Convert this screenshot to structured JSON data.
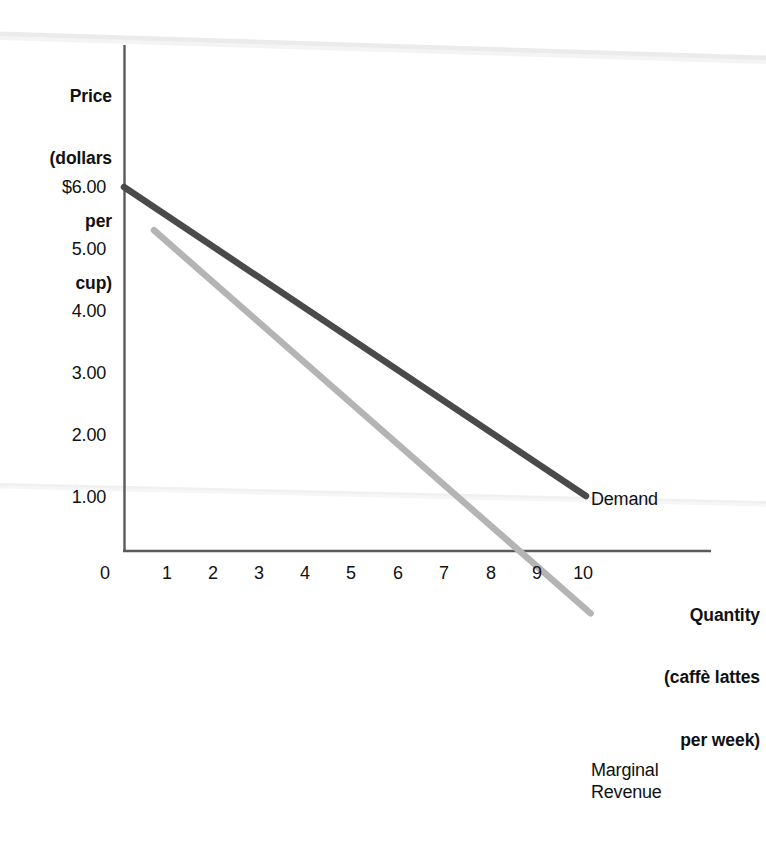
{
  "chart_data": {
    "type": "line",
    "title": "",
    "subtitle": "",
    "xlabel": "Quantity (caffè lattes per week)",
    "ylabel": "Price (dollars per cup)",
    "xlim": [
      0,
      10
    ],
    "ylim": [
      0,
      6
    ],
    "grid": false,
    "legend_position": "inline-end-of-line",
    "x_tick_labels": [
      "0",
      "1",
      "2",
      "3",
      "4",
      "5",
      "6",
      "7",
      "8",
      "9",
      "10"
    ],
    "x_tick_values": [
      0,
      1,
      2,
      3,
      4,
      5,
      6,
      7,
      8,
      9,
      10
    ],
    "y_tick_labels": [
      "$6.00",
      "5.00",
      "4.00",
      "3.00",
      "2.00",
      "1.00"
    ],
    "y_tick_values": [
      6,
      5,
      4,
      3,
      2,
      1
    ],
    "series": [
      {
        "name": "Demand",
        "color": "#4a4a4a",
        "x": [
          0,
          10
        ],
        "values": [
          6.0,
          1.0
        ]
      },
      {
        "name": "Marginal Revenue",
        "color": "#b4b4b4",
        "x": [
          0.65,
          10.1
        ],
        "values": [
          5.3,
          -0.9
        ]
      }
    ],
    "annotations": [
      {
        "text": "Demand",
        "x": 10.2,
        "y": 1.0
      },
      {
        "text": "Marginal\nRevenue",
        "x": 10.2,
        "y": -0.85
      }
    ]
  },
  "axis_titles": {
    "y_line1": "Price",
    "y_line2": "(dollars",
    "y_line3": "per",
    "y_line4": "cup)",
    "x_line1": "Quantity",
    "x_line2": "(caffè lattes",
    "x_line3": "per week)"
  },
  "y_ticks": [
    {
      "label": "$6.00"
    },
    {
      "label": "5.00"
    },
    {
      "label": "4.00"
    },
    {
      "label": "3.00"
    },
    {
      "label": "2.00"
    },
    {
      "label": "1.00"
    }
  ],
  "x_ticks": [
    {
      "label": "0"
    },
    {
      "label": "1"
    },
    {
      "label": "2"
    },
    {
      "label": "3"
    },
    {
      "label": "4"
    },
    {
      "label": "5"
    },
    {
      "label": "6"
    },
    {
      "label": "7"
    },
    {
      "label": "8"
    },
    {
      "label": "9"
    },
    {
      "label": "10"
    }
  ],
  "series_labels": {
    "demand": "Demand",
    "marginal_revenue_line1": "Marginal",
    "marginal_revenue_line2": "Revenue"
  },
  "colors": {
    "demand_line": "#4a4a4a",
    "marginal_revenue_line": "#b4b4b4",
    "axis": "#5a5a5a",
    "text": "#111111",
    "scan_artifact": "#ececec",
    "background": "#ffffff"
  }
}
